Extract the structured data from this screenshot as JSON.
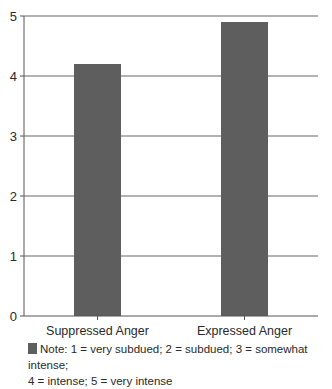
{
  "chart_data": {
    "type": "bar",
    "title": "",
    "xlabel": "",
    "ylabel": "",
    "categories": [
      "Suppressed Anger",
      "Expressed Anger"
    ],
    "values": [
      4.2,
      4.9
    ],
    "ylim": [
      0,
      5
    ],
    "yticks": [
      0,
      1,
      2,
      3,
      4,
      5
    ],
    "grid": true,
    "bar_color": "#5e5e5e",
    "legend": {
      "placement": "bottom",
      "entries": [
        "Note: 1 = very subdued; 2 = subdued; 3 = somewhat intense; 4 = intense; 5 = very intense"
      ]
    }
  },
  "legend_text_line1": "Note: 1 = very subdued; 2 = subdued; 3 = somewhat intense;",
  "legend_text_line2": "4 = intense; 5 = very intense"
}
